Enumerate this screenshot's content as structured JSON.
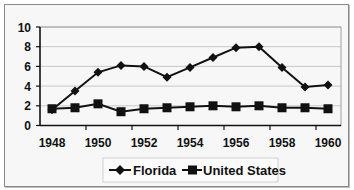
{
  "chart_data": {
    "type": "line",
    "title": "",
    "xlabel": "",
    "ylabel": "",
    "x": [
      1948,
      1949,
      1950,
      1951,
      1952,
      1953,
      1954,
      1955,
      1956,
      1957,
      1958,
      1959,
      1960
    ],
    "x_tick_labels": [
      "1948",
      "1950",
      "1952",
      "1954",
      "1956",
      "1958",
      "1960"
    ],
    "y_tick_labels": [
      "0",
      "2",
      "4",
      "6",
      "8",
      "10"
    ],
    "ylim": [
      0,
      10
    ],
    "grid": true,
    "legend_position": "bottom",
    "series": [
      {
        "name": "Florida",
        "marker": "diamond",
        "values": [
          1.6,
          3.5,
          5.4,
          6.1,
          6.0,
          4.9,
          5.9,
          6.9,
          7.9,
          8.0,
          5.9,
          3.9,
          4.1
        ]
      },
      {
        "name": "United States",
        "marker": "square",
        "values": [
          1.7,
          1.8,
          2.2,
          1.4,
          1.7,
          1.8,
          1.9,
          2.0,
          1.9,
          2.0,
          1.8,
          1.8,
          1.7
        ]
      }
    ]
  },
  "legend": {
    "items": [
      {
        "label": "Florida",
        "icon": "diamond-marker-line"
      },
      {
        "label": "United States",
        "icon": "square-marker-line"
      }
    ]
  },
  "colors": {
    "line": "#111111",
    "gridline": "#c8c8c8",
    "plot_border": "#a0a0a0",
    "background": "#f7f7f7"
  }
}
